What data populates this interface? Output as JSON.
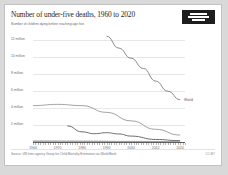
{
  "header": {
    "title": "Number of under-five deaths, 1960 to 2020",
    "subtitle": "Number of children dying before reaching age five.",
    "logo_name": "our-world-in-data-logo"
  },
  "footer": {
    "source": "Source: UN Inter-agency Group for Child Mortality Estimation via World Bank",
    "license": "CC BY"
  },
  "annotations": {
    "world_tag": "World"
  },
  "legend": {
    "position": "right",
    "entries": [
      "India",
      "China",
      "Brazil",
      "Zimbabwe",
      "Haiti",
      "Botswana"
    ]
  },
  "chart_data": {
    "type": "line",
    "title": "Number of under-five deaths, 1960 to 2020",
    "subtitle": "Number of children dying before reaching age five.",
    "xlabel": "",
    "ylabel": "",
    "xlim": [
      1960,
      2022
    ],
    "ylim": [
      0,
      13000000
    ],
    "grid": true,
    "xticks": [
      1960,
      1970,
      1980,
      1990,
      2000,
      2010,
      2020
    ],
    "xtick_labels": [
      "1960",
      "1970",
      "1980",
      "1990",
      "2000",
      "2010",
      "2020"
    ],
    "yticks": [
      2000000,
      4000000,
      6000000,
      8000000,
      10000000,
      12000000
    ],
    "ytick_labels": [
      "2 million",
      "4 million",
      "6 million",
      "8 million",
      "10 million",
      "12 million"
    ],
    "series": [
      {
        "name": "World",
        "color": "#7d7d7d",
        "x": [
          1990,
          1995,
          2000,
          2005,
          2010,
          2015,
          2020
        ],
        "values": [
          12500000,
          11100000,
          9900000,
          8700000,
          7200000,
          6000000,
          5000000
        ]
      },
      {
        "name": "India",
        "color": "#8c8c8c",
        "x": [
          1960,
          1970,
          1980,
          1990,
          2000,
          2010,
          2020
        ],
        "values": [
          4300000,
          4450000,
          4300000,
          3500000,
          2500000,
          1500000,
          820000
        ]
      },
      {
        "name": "China",
        "color": "#5e5e5e",
        "x": [
          1974,
          1980,
          1985,
          1990,
          1995,
          2000,
          2010,
          2020
        ],
        "values": [
          1900000,
          1200000,
          980000,
          1100000,
          950000,
          700000,
          300000,
          160000
        ]
      },
      {
        "name": "Brazil",
        "color": "#9a9a9a",
        "x": [
          1960,
          1980,
          2000,
          2020
        ],
        "values": [
          160000,
          130000,
          80000,
          40000
        ]
      },
      {
        "name": "Zimbabwe",
        "color": "#9a9a9a",
        "x": [
          1960,
          1980,
          2000,
          2020
        ],
        "values": [
          60000,
          45000,
          40000,
          25000
        ]
      },
      {
        "name": "Haiti",
        "color": "#9a9a9a",
        "x": [
          1960,
          1980,
          2000,
          2020
        ],
        "values": [
          40000,
          30000,
          25000,
          15000
        ]
      },
      {
        "name": "Botswana",
        "color": "#9a9a9a",
        "x": [
          1960,
          1980,
          2000,
          2020
        ],
        "values": [
          8000,
          6000,
          5000,
          2000
        ]
      }
    ]
  }
}
